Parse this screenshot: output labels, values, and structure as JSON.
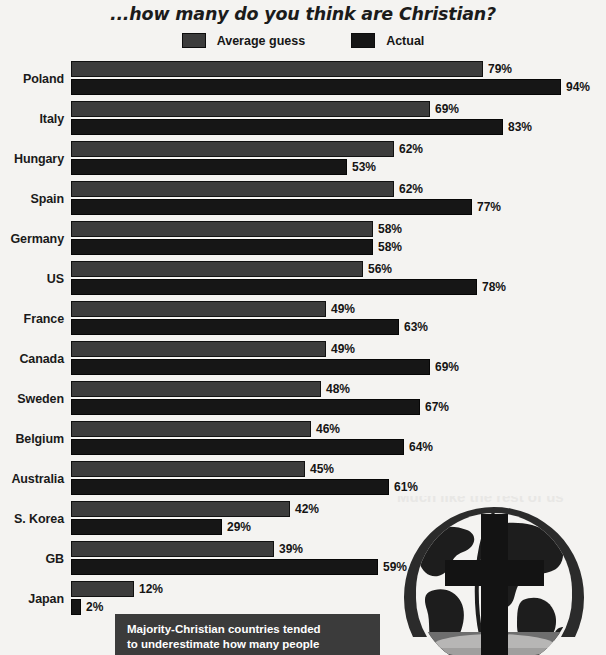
{
  "title": {
    "line_upper": "If you had to guess, out of every 100 people...",
    "line_lower": "...how many do you think are Christian?"
  },
  "legend": {
    "items": [
      {
        "label": "Average guess",
        "color": "#3c3c3c",
        "swatch_name": "legend-swatch-average-guess"
      },
      {
        "label": "Actual",
        "color": "#161616",
        "swatch_name": "legend-swatch-actual"
      }
    ]
  },
  "caption": {
    "line1": "Majority-Christian countries tended",
    "line2": "to underestimate how many people"
  },
  "graphic": {
    "ghost_text": "Much like the rest of us",
    "icon_name": "globe-with-cross-icon"
  },
  "chart_data": {
    "type": "bar",
    "orientation": "horizontal",
    "title": "...how many do you think are Christian?",
    "xlabel": "",
    "ylabel": "",
    "xlim": [
      0,
      100
    ],
    "grid": false,
    "legend_position": "top-center",
    "value_suffix": "%",
    "categories": [
      "Poland",
      "Italy",
      "Hungary",
      "Spain",
      "Germany",
      "US",
      "France",
      "Canada",
      "Sweden",
      "Belgium",
      "Australia",
      "S. Korea",
      "GB",
      "Japan"
    ],
    "series": [
      {
        "name": "Average guess",
        "color": "#3c3c3c",
        "values": [
          79,
          69,
          62,
          62,
          58,
          56,
          49,
          49,
          48,
          46,
          45,
          42,
          39,
          12
        ],
        "labels": [
          "79%",
          "69%",
          "62%",
          "62%",
          "58%",
          "56%",
          "49%",
          "49%",
          "48%",
          "46%",
          "45%",
          "42%",
          "39%",
          "12%"
        ]
      },
      {
        "name": "Actual",
        "color": "#161616",
        "values": [
          94,
          83,
          53,
          77,
          58,
          78,
          63,
          69,
          67,
          64,
          61,
          29,
          59,
          2
        ],
        "labels": [
          "94%",
          "83%",
          "53%",
          "77%",
          "58%",
          "78%",
          "63%",
          "69%",
          "67%",
          "64%",
          "61%",
          "29%",
          "59%",
          "2%"
        ]
      }
    ]
  }
}
